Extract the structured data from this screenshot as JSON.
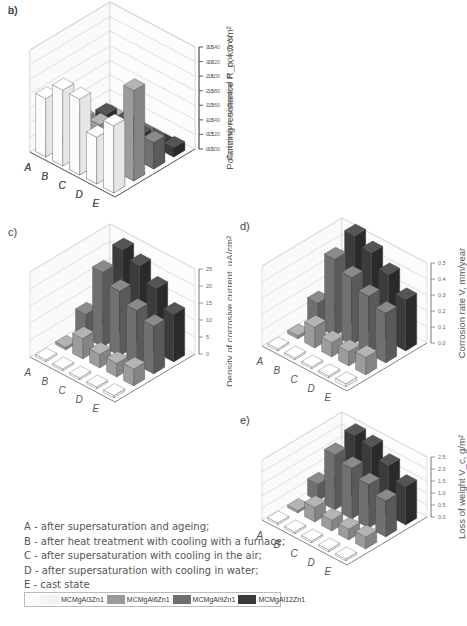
{
  "chart_data": [
    {
      "panel": "a)",
      "type": "bar3d",
      "categories": [
        "A",
        "B",
        "C",
        "D",
        "E"
      ],
      "ylabel": "Corrosive potential E_cor, mV",
      "yticks": [
        "-1500",
        "-1520",
        "-1540",
        "-1560",
        "-1580",
        "-1600",
        "-1620",
        "-1640"
      ],
      "ylim": [
        -1640,
        -1500
      ],
      "series": [
        {
          "name": "MCMgAl3Zn1",
          "values": [
            -1565,
            -1590,
            -1570,
            -1580,
            -1595
          ]
        },
        {
          "name": "MCMgAl6Zn1",
          "values": [
            -1560,
            -1550,
            -1555,
            -1565,
            -1640
          ]
        },
        {
          "name": "MCMgAl9Zn1",
          "values": [
            -1540,
            -1575,
            -1570,
            -1570,
            -1575
          ]
        },
        {
          "name": "MCMgAl12Zn1",
          "values": [
            -1520,
            -1540,
            -1560,
            -1565,
            -1560
          ]
        }
      ]
    },
    {
      "panel": "b)",
      "type": "bar3d",
      "categories": [
        "A",
        "B",
        "C",
        "D",
        "E"
      ],
      "ylabel": "Polarizing resistance R_p, kΩ cm²",
      "yticks": [
        "0.0",
        "0.5",
        "1.0",
        "1.5",
        "2.0",
        "2.5",
        "3.0",
        "3.5"
      ],
      "ylim": [
        0,
        3.5
      ],
      "series": [
        {
          "name": "MCMgAl3Zn1",
          "values": [
            2.0,
            2.6,
            2.6,
            1.6,
            2.3
          ]
        },
        {
          "name": "MCMgAl6Zn1",
          "values": [
            0.3,
            1.2,
            1.3,
            1.4,
            3.1
          ]
        },
        {
          "name": "MCMgAl9Zn1",
          "values": [
            0.2,
            0.2,
            0.2,
            0.2,
            0.9
          ]
        },
        {
          "name": "MCMgAl12Zn1",
          "values": [
            0.2,
            0.2,
            0.1,
            0.1,
            0.3
          ]
        }
      ]
    },
    {
      "panel": "c)",
      "type": "bar3d",
      "categories": [
        "A",
        "B",
        "C",
        "D",
        "E"
      ],
      "ylabel": "Density of corrosive current, µA/cm²",
      "yticks": [
        "0",
        "5",
        "10",
        "15",
        "20",
        "25"
      ],
      "ylim": [
        0,
        25
      ],
      "series": [
        {
          "name": "MCMgAl3Zn1",
          "values": [
            0.3,
            0.5,
            0.4,
            0.5,
            0.7
          ]
        },
        {
          "name": "MCMgAl6Zn1",
          "values": [
            0.8,
            6,
            4,
            4,
            5
          ]
        },
        {
          "name": "MCMgAl9Zn1",
          "values": [
            7,
            22,
            19,
            16,
            14
          ]
        },
        {
          "name": "MCMgAl12Zn1",
          "values": [
            0.5,
            25,
            23,
            19,
            14
          ]
        }
      ]
    },
    {
      "panel": "d)",
      "type": "bar3d",
      "categories": [
        "A",
        "B",
        "C",
        "D",
        "E"
      ],
      "ylabel": "Corrosion rate V, mm/year",
      "yticks": [
        "0.0",
        "0.1",
        "0.2",
        "0.3",
        "0.4",
        "0.5"
      ],
      "ylim": [
        0,
        0.5
      ],
      "series": [
        {
          "name": "MCMgAl3Zn1",
          "values": [
            0.01,
            0.01,
            0.01,
            0.01,
            0.02
          ]
        },
        {
          "name": "MCMgAl6Zn1",
          "values": [
            0.02,
            0.13,
            0.09,
            0.09,
            0.11
          ]
        },
        {
          "name": "MCMgAl9Zn1",
          "values": [
            0.15,
            0.48,
            0.42,
            0.36,
            0.31
          ]
        },
        {
          "name": "MCMgAl12Zn1",
          "values": [
            0.01,
            0.55,
            0.5,
            0.42,
            0.32
          ]
        }
      ]
    },
    {
      "panel": "e)",
      "type": "bar3d",
      "categories": [
        "A",
        "B",
        "C",
        "D",
        "E"
      ],
      "ylabel": "Loss of weight V_c, g/m²",
      "yticks": [
        "0.0",
        "0.5",
        "1.0",
        "1.5",
        "2.0",
        "2.5"
      ],
      "ylim": [
        0,
        2.5
      ],
      "series": [
        {
          "name": "MCMgAl3Zn1",
          "values": [
            0.05,
            0.05,
            0.05,
            0.05,
            0.08
          ]
        },
        {
          "name": "MCMgAl6Zn1",
          "values": [
            0.1,
            0.6,
            0.45,
            0.45,
            0.5
          ]
        },
        {
          "name": "MCMgAl9Zn1",
          "values": [
            0.7,
            2.3,
            2.1,
            1.8,
            1.5
          ]
        },
        {
          "name": "MCMgAl12Zn1",
          "values": [
            0.05,
            2.6,
            2.5,
            2.1,
            1.6
          ]
        }
      ]
    }
  ],
  "notes": [
    "A - after supersaturation and ageing;",
    "B - after heat treatment with cooling with  a furnace;",
    "C - after supersaturation with cooling in the air;",
    "D - after supersaturation with cooling in water;",
    "E - cast state"
  ],
  "legend": [
    {
      "label": "MCMgAl3Zn1",
      "color": "#f4f4f4"
    },
    {
      "label": "MCMgAl6Zn1",
      "color": "#9a9a9a"
    },
    {
      "label": "MCMgAl9Zn1",
      "color": "#6e6e6e"
    },
    {
      "label": "MCMgAl12Zn1",
      "color": "#3a3a3a"
    }
  ]
}
